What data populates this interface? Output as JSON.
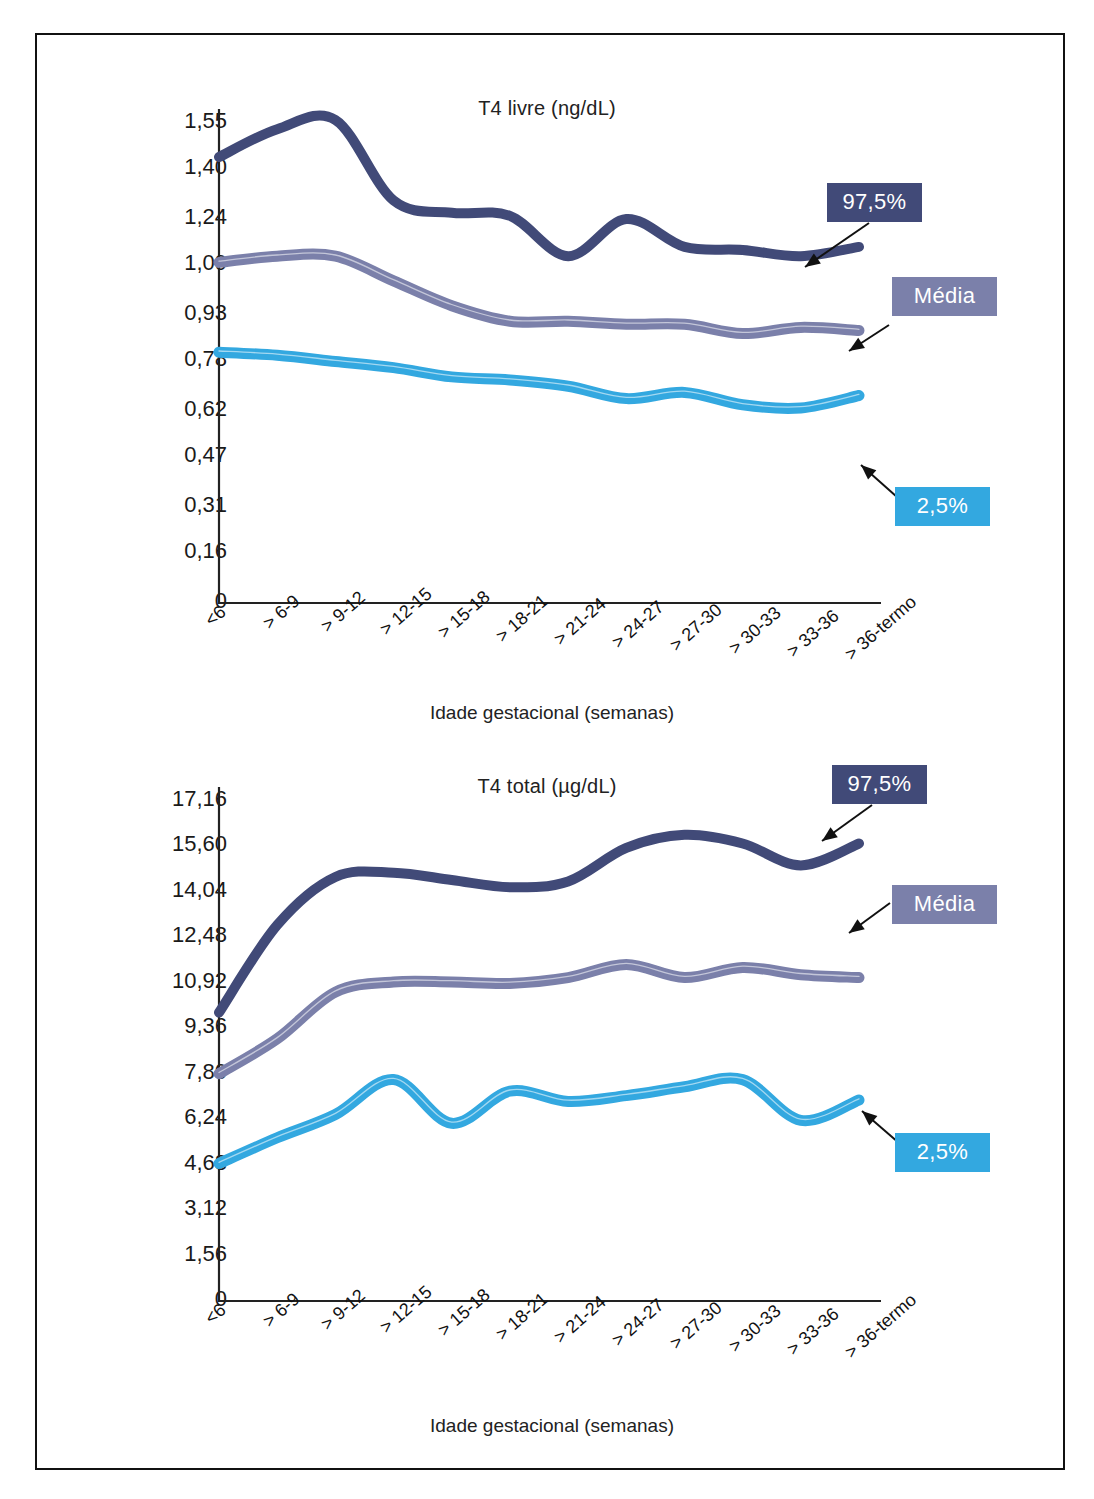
{
  "figure": {
    "frame_color": "#111111",
    "background": "#ffffff"
  },
  "series_colors": {
    "upper": "#414a78",
    "mean": "#7b80aa",
    "lower": "#33a8e0"
  },
  "legend": {
    "upper_label": "97,5%",
    "mean_label": "Média",
    "lower_label": "2,5%"
  },
  "axis": {
    "x_title": "Idade gestacional (semanas)",
    "categories": [
      "<6",
      "> 6-9",
      "> 9-12",
      "> 12-15",
      "> 15-18",
      "> 18-21",
      "> 21-24",
      "> 24-27",
      "> 27-30",
      "> 30-33",
      "> 33-36",
      "> 36-termo"
    ]
  },
  "chart_data": [
    {
      "type": "line",
      "title": "T4 livre (ng/dL)",
      "xlabel": "Idade gestacional (semanas)",
      "ylabel": "",
      "ylim": [
        0,
        1.55
      ],
      "grid": false,
      "legend_position": "right-annotations",
      "yticks": [
        "1,55",
        "1,40",
        "1,24",
        "1,09",
        "0,93",
        "0,78",
        "0,62",
        "0,47",
        "0,31",
        "0,16",
        "0"
      ],
      "ytick_values": [
        1.55,
        1.4,
        1.24,
        1.09,
        0.93,
        0.78,
        0.62,
        0.47,
        0.31,
        0.16,
        0
      ],
      "categories": [
        "<6",
        "> 6-9",
        "> 9-12",
        "> 12-15",
        "> 15-18",
        "> 18-21",
        "> 21-24",
        "> 24-27",
        "> 27-30",
        "> 30-33",
        "> 33-36",
        "> 36-termo"
      ],
      "series": [
        {
          "name": "97,5%",
          "color": "#414a78",
          "values": [
            1.44,
            1.53,
            1.56,
            1.3,
            1.26,
            1.25,
            1.12,
            1.24,
            1.15,
            1.14,
            1.12,
            1.15
          ]
        },
        {
          "name": "Média",
          "color": "#7b80aa",
          "values": [
            1.1,
            1.12,
            1.12,
            1.04,
            0.96,
            0.91,
            0.91,
            0.9,
            0.9,
            0.87,
            0.89,
            0.88
          ]
        },
        {
          "name": "2,5%",
          "color": "#33a8e0",
          "values": [
            0.81,
            0.8,
            0.78,
            0.76,
            0.73,
            0.72,
            0.7,
            0.66,
            0.68,
            0.64,
            0.63,
            0.67
          ]
        }
      ]
    },
    {
      "type": "line",
      "title": "T4 total (µg/dL)",
      "xlabel": "Idade gestacional (semanas)",
      "ylabel": "",
      "ylim": [
        0,
        17.16
      ],
      "grid": false,
      "legend_position": "right-annotations",
      "yticks": [
        "17,16",
        "15,60",
        "14,04",
        "12,48",
        "10,92",
        "9,36",
        "7,80",
        "6,24",
        "4,68",
        "3,12",
        "1,56",
        "0"
      ],
      "ytick_values": [
        17.16,
        15.6,
        14.04,
        12.48,
        10.92,
        9.36,
        7.8,
        6.24,
        4.68,
        3.12,
        1.56,
        0
      ],
      "categories": [
        "<6",
        "> 6-9",
        "> 9-12",
        "> 12-15",
        "> 15-18",
        "> 18-21",
        "> 21-24",
        "> 24-27",
        "> 27-30",
        "> 30-33",
        "> 33-36",
        "> 36-termo"
      ],
      "series": [
        {
          "name": "97,5%",
          "color": "#414a78",
          "values": [
            9.9,
            12.9,
            14.55,
            14.7,
            14.45,
            14.2,
            14.4,
            15.55,
            16.0,
            15.7,
            14.95,
            15.7
          ]
        },
        {
          "name": "Média",
          "color": "#7b80aa",
          "values": [
            7.8,
            9.0,
            10.6,
            10.95,
            10.95,
            10.9,
            11.1,
            11.55,
            11.1,
            11.45,
            11.2,
            11.1
          ]
        },
        {
          "name": "2,5%",
          "color": "#33a8e0",
          "values": [
            4.72,
            5.6,
            6.4,
            7.6,
            6.1,
            7.2,
            6.85,
            7.05,
            7.35,
            7.6,
            6.2,
            6.9
          ]
        }
      ]
    }
  ]
}
